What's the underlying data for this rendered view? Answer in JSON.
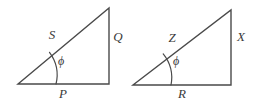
{
  "figure": {
    "background_color": "#ffffff",
    "stroke_color": "#4a4a4a",
    "label_color": "#3a3a3a",
    "stroke_width": 1.4,
    "arc_stroke_width": 1.2,
    "triangles": [
      {
        "id": "left-triangle",
        "name": "triangle-SQP",
        "vertices": {
          "origin": [
            18,
            84
          ],
          "right_angle": [
            109,
            84
          ],
          "apex": [
            109,
            8
          ]
        },
        "arc": {
          "center": [
            18,
            84
          ],
          "radius": 38,
          "start": [
            56,
            84
          ],
          "end": [
            49.5,
            52.3
          ],
          "large_arc": 0,
          "sweep": 0
        },
        "labels": {
          "hypotenuse": {
            "text": "S",
            "x": 52,
            "y": 36
          },
          "vertical": {
            "text": "Q",
            "x": 118,
            "y": 38
          },
          "base": {
            "text": "P",
            "x": 63,
            "y": 95
          },
          "angle": {
            "text": "ϕ",
            "x": 61,
            "y": 62
          }
        }
      },
      {
        "id": "right-triangle",
        "name": "triangle-ZXR",
        "vertices": {
          "origin": [
            133,
            85
          ],
          "right_angle": [
            231,
            85
          ],
          "apex": [
            231,
            10
          ]
        },
        "arc": {
          "center": [
            133,
            85
          ],
          "radius": 38,
          "start": [
            171,
            85
          ],
          "end": [
            163.2,
            53.9
          ],
          "large_arc": 0,
          "sweep": 0
        },
        "labels": {
          "hypotenuse": {
            "text": "Z",
            "x": 172,
            "y": 39
          },
          "vertical": {
            "text": "X",
            "x": 241,
            "y": 38
          },
          "base": {
            "text": "R",
            "x": 182,
            "y": 95
          },
          "angle": {
            "text": "ϕ",
            "x": 176,
            "y": 62
          }
        }
      }
    ]
  }
}
